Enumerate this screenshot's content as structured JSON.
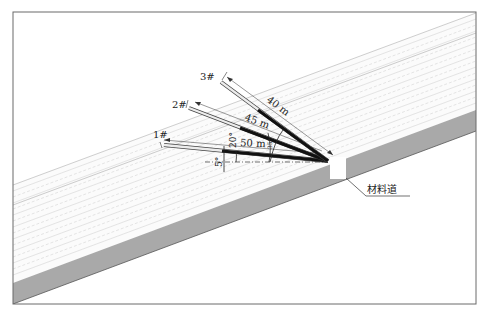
{
  "diagram": {
    "type": "slope-drilling-fan",
    "colors": {
      "frame": "#6a6a6a",
      "slope_face": "#a9a9a9",
      "surface_lines": "#cfcfcf",
      "rod_dark": "#111111",
      "rod_light": "#ececec",
      "text": "#222222"
    },
    "boreholes": [
      {
        "id": "1",
        "label": "1#",
        "length_label": "50 m",
        "angle_label": "5°"
      },
      {
        "id": "2",
        "label": "2#",
        "length_label": "45 m",
        "angle_label": "20°"
      },
      {
        "id": "3",
        "label": "3#",
        "length_label": "40 m",
        "angle_label": "35°"
      }
    ],
    "callout": {
      "label": "材料道"
    }
  }
}
